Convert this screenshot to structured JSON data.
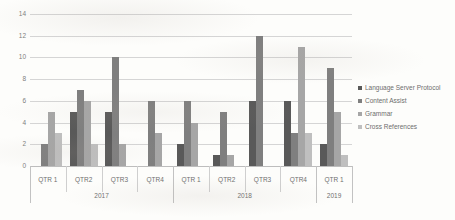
{
  "chart_data": {
    "type": "bar",
    "title": "",
    "xlabel": "",
    "ylabel": "",
    "ylim": [
      0,
      14
    ],
    "grid": true,
    "legend_position": "right",
    "y_ticks": [
      0,
      2,
      4,
      6,
      8,
      10,
      12,
      14
    ],
    "categories": [
      "QTR 1",
      "QTR2",
      "QTR3",
      "QTR4",
      "QTR 1",
      "QTR2",
      "QTR3",
      "QTR4",
      "QTR 1"
    ],
    "groups": [
      {
        "label": "2017",
        "categories": [
          "QTR 1",
          "QTR2",
          "QTR3",
          "QTR4"
        ]
      },
      {
        "label": "2018",
        "categories": [
          "QTR 1",
          "QTR2",
          "QTR3",
          "QTR4"
        ]
      },
      {
        "label": "2019",
        "categories": [
          "QTR 1"
        ]
      }
    ],
    "series": [
      {
        "name": "Language Server Protocol",
        "color": "#595959",
        "values": [
          0,
          5,
          5,
          0,
          2,
          1,
          6,
          6,
          2
        ]
      },
      {
        "name": "Content Assist",
        "color": "#7f7f7f",
        "values": [
          2,
          7,
          10,
          6,
          6,
          5,
          12,
          3,
          9
        ]
      },
      {
        "name": "Grammar",
        "color": "#a6a6a6",
        "values": [
          5,
          6,
          2,
          3,
          4,
          1,
          0,
          11,
          5
        ]
      },
      {
        "name": "Cross References",
        "color": "#bfbfbf",
        "values": [
          3,
          2,
          0,
          0,
          0,
          0,
          0,
          3,
          1
        ]
      }
    ]
  },
  "legend": {
    "items": [
      {
        "label": "Language Server Protocol",
        "color": "#595959"
      },
      {
        "label": "Content Assist",
        "color": "#7f7f7f"
      },
      {
        "label": "Grammar",
        "color": "#a6a6a6"
      },
      {
        "label": "Cross References",
        "color": "#bfbfbf"
      }
    ]
  }
}
